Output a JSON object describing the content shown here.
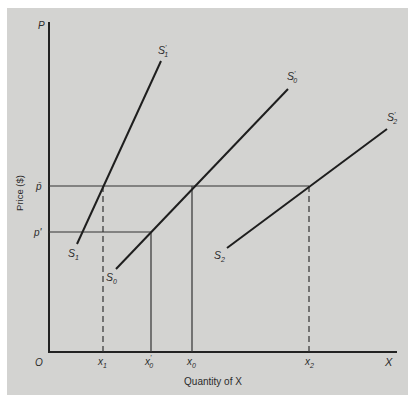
{
  "diagram": {
    "type": "supply-curves",
    "colors": {
      "background": "#d3d3d1",
      "ink": "#222222"
    },
    "axes": {
      "y_symbol": "P",
      "x_symbol": "X",
      "origin": "O",
      "y_title": "Price ($)",
      "x_title": "Quantity of X"
    },
    "price_levels": [
      {
        "name": "p-bar",
        "label": "p̄"
      },
      {
        "name": "p-prime",
        "label": "p'"
      }
    ],
    "quantity_ticks": [
      {
        "name": "x1",
        "base": "x",
        "sub": "1",
        "prime": "",
        "line": "dashed"
      },
      {
        "name": "x0-prime",
        "base": "x",
        "sub": "0",
        "prime": "'",
        "line": "solid"
      },
      {
        "name": "x0",
        "base": "x",
        "sub": "0",
        "prime": "",
        "line": "solid"
      },
      {
        "name": "x2",
        "base": "x",
        "sub": "2",
        "prime": "",
        "line": "dashed"
      }
    ],
    "curves": [
      {
        "name": "S1",
        "start_label": {
          "base": "S",
          "sub": "1",
          "prime": ""
        },
        "end_label": {
          "base": "S",
          "sub": "1",
          "prime": "'"
        }
      },
      {
        "name": "S0",
        "start_label": {
          "base": "S",
          "sub": "0",
          "prime": ""
        },
        "end_label": {
          "base": "S",
          "sub": "0",
          "prime": "'"
        }
      },
      {
        "name": "S2",
        "start_label": {
          "base": "S",
          "sub": "2",
          "prime": ""
        },
        "end_label": {
          "base": "S",
          "sub": "2",
          "prime": "'"
        }
      }
    ]
  }
}
